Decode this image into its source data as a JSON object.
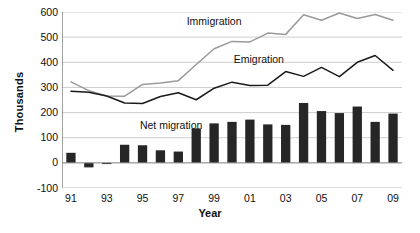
{
  "chart_data": {
    "type": "bar",
    "title": "",
    "xlabel": "Year",
    "ylabel": "Thousands",
    "ylim": [
      -100,
      600
    ],
    "ytick_values": [
      600,
      500,
      400,
      300,
      200,
      100,
      0,
      -100
    ],
    "ytick_labels": [
      "600",
      "500",
      "400",
      "300",
      "200",
      "100",
      "0",
      "-100"
    ],
    "grid": true,
    "legend_position": "inline-annotations",
    "x": [
      1991,
      1992,
      1993,
      1994,
      1995,
      1996,
      1997,
      1998,
      1999,
      2000,
      2001,
      2002,
      2003,
      2004,
      2005,
      2006,
      2007,
      2008,
      2009
    ],
    "xtick_labels": [
      "91",
      "93",
      "95",
      "97",
      "99",
      "01",
      "03",
      "05",
      "07",
      "09"
    ],
    "xtick_years": [
      1991,
      1993,
      1995,
      1997,
      1999,
      2001,
      2003,
      2005,
      2007,
      2009
    ],
    "series": [
      {
        "name": "Immigration",
        "type": "line",
        "color": "#9a9a9a",
        "values": [
          322,
          287,
          266,
          265,
          312,
          318,
          327,
          391,
          454,
          483,
          481,
          516,
          511,
          589,
          567,
          596,
          574,
          590,
          567
        ]
      },
      {
        "name": "Emigration",
        "type": "line",
        "color": "#1a1a1a",
        "values": [
          285,
          281,
          266,
          238,
          236,
          264,
          279,
          251,
          297,
          321,
          308,
          309,
          363,
          344,
          380,
          343,
          400,
          427,
          368
        ]
      },
      {
        "name": "Net migration",
        "type": "bar",
        "color": "#262626",
        "values": [
          40,
          -18,
          -3,
          72,
          70,
          50,
          45,
          137,
          157,
          163,
          172,
          153,
          151,
          238,
          206,
          198,
          224,
          163,
          196
        ]
      }
    ],
    "annotations": [
      {
        "text": "Immigration",
        "x": 1999.0,
        "y": 560
      },
      {
        "text": "Emigration",
        "x": 2001.5,
        "y": 410
      },
      {
        "text": "Net migration",
        "x": 1996.6,
        "y": 148
      }
    ]
  }
}
